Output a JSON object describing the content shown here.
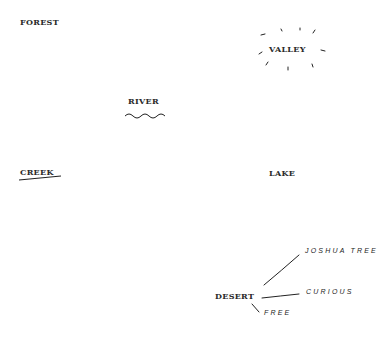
{
  "words": {
    "forest": "FOREST",
    "valley": "VALLEY",
    "river": "RIVER",
    "creek": "CREEK",
    "lake": "LAKE",
    "desert": "DESERT"
  },
  "desert_branches": {
    "joshua_tree": "JOSHUA TREE",
    "curious": "CURIOUS",
    "free": "FREE"
  },
  "colors": {
    "text": "#2a2a2a",
    "stroke": "#222222",
    "background": "#ffffff"
  }
}
